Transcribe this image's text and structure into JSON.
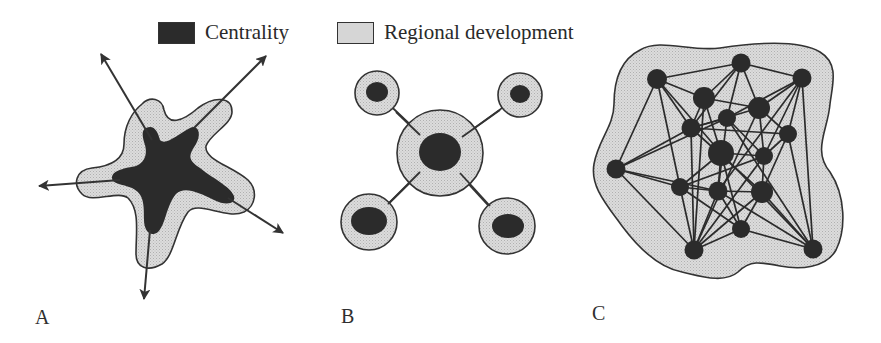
{
  "legend": {
    "items": [
      {
        "label": "Centrality",
        "swatch": "dark"
      },
      {
        "label": "Regional development",
        "swatch": "light-dotted"
      }
    ]
  },
  "panels": [
    {
      "label": "A",
      "type": "star-shaped centrality with radial development axes",
      "arrows": 5
    },
    {
      "label": "B",
      "type": "hub-and-satellite centralities connected by links",
      "nodes": 5
    },
    {
      "label": "C",
      "type": "polycentric network of interconnected centralities",
      "nodes": 17
    }
  ],
  "colors": {
    "centrality": "#2b2b2b",
    "regional_development": "#d6d6d6",
    "outline": "#333333",
    "background": "#ffffff"
  }
}
